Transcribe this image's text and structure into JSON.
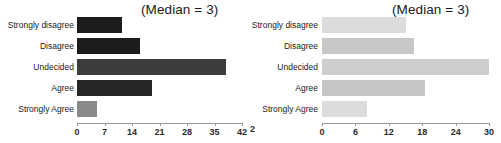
{
  "figure": {
    "width": 501,
    "height": 143,
    "background": "#ffffff"
  },
  "panels": [
    {
      "id": "left",
      "median_note": "(Median = 3)",
      "label_right_px": 74,
      "axis_origin_px": 77,
      "px_per_unit": 3.93,
      "clip_remnant": "",
      "chart_data": {
        "type": "bar",
        "orientation": "horizontal",
        "title": "",
        "subtitle": "(Median = 3)",
        "xlabel": "",
        "ylabel": "",
        "categories": [
          "Strongly disagree",
          "Disagree",
          "Undecided",
          "Agree",
          "Strongly Agree"
        ],
        "values": [
          11.5,
          16,
          38,
          19,
          5
        ],
        "bar_colors": [
          "#1c1c1c",
          "#1c1c1c",
          "#3d3d3d",
          "#262626",
          "#8a8a8a"
        ],
        "xlim": [
          0,
          42
        ],
        "xticks": [
          0,
          7,
          14,
          21,
          28,
          35,
          42
        ],
        "xtick_labels": [
          "0",
          "7",
          "14",
          "21",
          "28",
          "35",
          "42"
        ],
        "grid": false,
        "legend": "none"
      }
    },
    {
      "id": "right",
      "median_note": "(Median = 3)",
      "label_right_px": 68,
      "axis_origin_px": 72,
      "px_per_unit": 5.57,
      "clip_remnant": "2",
      "chart_data": {
        "type": "bar",
        "orientation": "horizontal",
        "title": "",
        "subtitle": "(Median = 3)",
        "xlabel": "",
        "ylabel": "",
        "categories": [
          "Strongly disagree",
          "Disagree",
          "Undecided",
          "Agree",
          "Strongly Agree"
        ],
        "values": [
          15,
          16.5,
          30,
          18.5,
          8
        ],
        "bar_colors": [
          "#dcdcdc",
          "#c8c8c8",
          "#cdcdcd",
          "#c5c5c5",
          "#dcdcdc"
        ],
        "xlim": [
          0,
          30
        ],
        "xticks": [
          0,
          6,
          12,
          18,
          24,
          30
        ],
        "xtick_labels": [
          "0",
          "6",
          "12",
          "18",
          "24",
          "30"
        ],
        "grid": false,
        "legend": "none"
      }
    }
  ]
}
